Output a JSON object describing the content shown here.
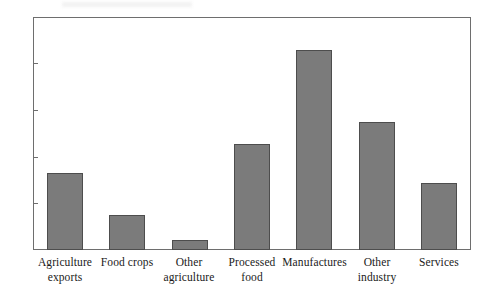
{
  "chart_data": {
    "type": "bar",
    "title": "",
    "xlabel": "",
    "ylabel": "",
    "ylim": [
      0,
      50
    ],
    "yticks": [
      0,
      10,
      20,
      30,
      40,
      50
    ],
    "grid": false,
    "legend": false,
    "categories": [
      "Agriculture exports",
      "Food crops",
      "Other agriculture",
      "Processed food",
      "Manufactures",
      "Other industry",
      "Services"
    ],
    "category_lines": [
      [
        "Agriculture",
        "exports"
      ],
      [
        "Food crops",
        ""
      ],
      [
        "Other",
        "agriculture"
      ],
      [
        "Processed",
        "food"
      ],
      [
        "Manufactures",
        ""
      ],
      [
        "Other",
        "industry"
      ],
      [
        "Services",
        ""
      ]
    ],
    "values": [
      16.7,
      7.5,
      2.2,
      22.8,
      43.0,
      27.6,
      14.5
    ],
    "bar_color": "#7b7b7b",
    "bar_edge_color": "#4d4d4d",
    "frame_color": "#6e6e6e"
  },
  "axis": {
    "y_tick_labels": [
      "50",
      "40",
      "30",
      "20",
      "10",
      "0"
    ]
  }
}
